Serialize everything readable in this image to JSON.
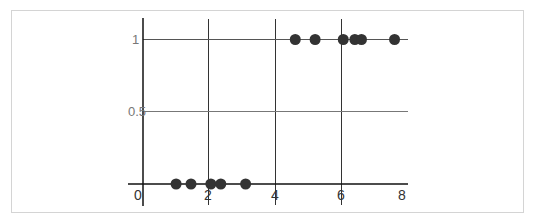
{
  "chart_data": {
    "type": "scatter",
    "title": "",
    "xlabel": "",
    "ylabel": "",
    "xlim": [
      0,
      8
    ],
    "ylim": [
      0,
      1
    ],
    "grid": true,
    "x_ticks": [
      "0",
      "2",
      "4",
      "6",
      "8"
    ],
    "y_ticks": [
      "0.5",
      "1"
    ],
    "series": [
      {
        "name": "points",
        "color": "#333333",
        "points": [
          {
            "x": 1.0,
            "y": 0
          },
          {
            "x": 1.45,
            "y": 0
          },
          {
            "x": 2.05,
            "y": 0
          },
          {
            "x": 2.35,
            "y": 0
          },
          {
            "x": 3.1,
            "y": 0
          },
          {
            "x": 4.6,
            "y": 1
          },
          {
            "x": 5.2,
            "y": 1
          },
          {
            "x": 6.05,
            "y": 1
          },
          {
            "x": 6.4,
            "y": 1
          },
          {
            "x": 6.6,
            "y": 1
          },
          {
            "x": 7.6,
            "y": 1
          }
        ]
      }
    ]
  },
  "labels": {
    "x0": "0",
    "x2": "2",
    "x4": "4",
    "x6": "6",
    "x8": "8",
    "y05": "0.5",
    "y1": "1"
  }
}
